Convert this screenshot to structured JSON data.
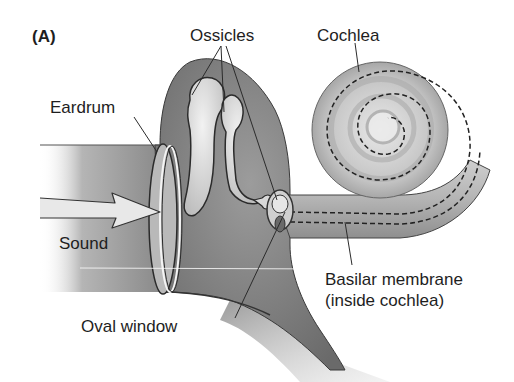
{
  "figure": {
    "panel_label": "(A)",
    "colors": {
      "tissue_dark": "#6f6f6f",
      "tissue_mid": "#9a9a9a",
      "tissue_light": "#d6d6d6",
      "outline": "#2b2b2b",
      "label_text": "#1e1e1e",
      "background": "#ffffff"
    }
  },
  "labels": {
    "ossicles": "Ossicles",
    "cochlea": "Cochlea",
    "eardrum": "Eardrum",
    "sound": "Sound",
    "oval_window": "Oval window",
    "basilar_line1": "Basilar membrane",
    "basilar_line2": "(inside cochlea)"
  },
  "structures": [
    {
      "id": "ear-canal",
      "name": "Ear canal"
    },
    {
      "id": "eardrum",
      "name": "Eardrum"
    },
    {
      "id": "ossicles",
      "name": "Ossicles",
      "count": 3
    },
    {
      "id": "oval-window",
      "name": "Oval window"
    },
    {
      "id": "cochlea",
      "name": "Cochlea (uncoiled section + spiral)"
    },
    {
      "id": "basilar-membrane",
      "name": "Basilar membrane (dashed line inside cochlea)"
    },
    {
      "id": "sound-arrow",
      "name": "Incoming sound arrow"
    }
  ]
}
